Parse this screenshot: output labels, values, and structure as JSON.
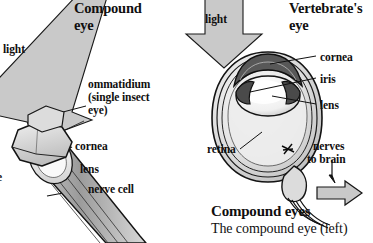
{
  "figure": {
    "background_color": "#ffffff",
    "arrow_fill": "#c9c9c9",
    "arrow_stroke": "#1a1a1a",
    "structure_fill_light": "#e8e8e8",
    "structure_fill_mid": "#b9b9b9",
    "structure_fill_dark": "#6e6e6e",
    "line_color": "#111111"
  },
  "left_panel": {
    "title_line1": "Compound",
    "title_line2": "eye",
    "light_label": "light",
    "ommatidium_label_line1": "ommatidium",
    "ommatidium_label_line2": "(single insect",
    "ommatidium_label_line3": "eye)",
    "edge_clipped_label": "e",
    "parts": [
      {
        "label": "cornea"
      },
      {
        "label": "lens"
      },
      {
        "label": "nerve cell"
      }
    ]
  },
  "right_panel": {
    "title_line1": "Vertebrate's",
    "title_line2": "eye",
    "light_label": "light",
    "parts": [
      {
        "label": "cornea"
      },
      {
        "label": "iris"
      },
      {
        "label": "lens"
      },
      {
        "label": "retina"
      }
    ],
    "nerves_label_line1": "nerves",
    "nerves_label_line2": "to brain"
  },
  "caption": {
    "heading": "Compound eyes",
    "body": "The compound eye (left)"
  }
}
